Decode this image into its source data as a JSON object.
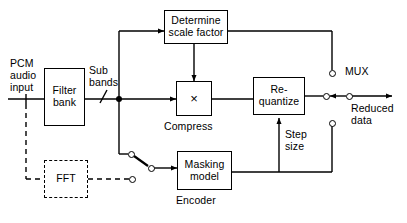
{
  "diagram": {
    "caption": "Encoder",
    "line_color": "#000000",
    "background": "#ffffff",
    "blocks": [
      {
        "id": "filter_bank",
        "label": "Filter\nbank",
        "style": "solid"
      },
      {
        "id": "determine_sf",
        "label": "Determine\nscale factor",
        "style": "solid"
      },
      {
        "id": "compress",
        "label": "×",
        "style": "solid"
      },
      {
        "id": "requantize",
        "label": "Re-\nquantize",
        "style": "solid"
      },
      {
        "id": "masking_model",
        "label": "Masking\nmodel",
        "style": "solid"
      },
      {
        "id": "fft",
        "label": "FFT",
        "style": "dashed"
      }
    ],
    "labels": [
      {
        "id": "pcm_audio_input",
        "text": "PCM\naudio\ninput"
      },
      {
        "id": "sub_bands",
        "text": "Sub\nbands"
      },
      {
        "id": "compress_label",
        "text": "Compress"
      },
      {
        "id": "mux",
        "text": "MUX"
      },
      {
        "id": "reduced_data",
        "text": "Reduced\ndata"
      },
      {
        "id": "step_size",
        "text": "Step\nsize"
      },
      {
        "id": "encoder",
        "text": "Encoder"
      }
    ]
  }
}
